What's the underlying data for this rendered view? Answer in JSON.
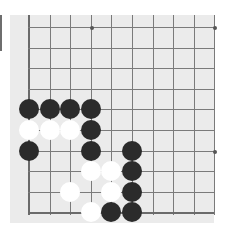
{
  "game": "Go board diagram (corner section)",
  "colors": {
    "board": "#ebebeb",
    "line": "#7a7a7a",
    "black_stone": "#2b2b2b",
    "white_stone": "#ffffff"
  },
  "grid": {
    "columns": 10,
    "rows": 10,
    "origin_x": 29,
    "origin_y": 27,
    "spacing": 20.6,
    "edge_left": true,
    "edge_bottom": true
  },
  "star_points": [
    {
      "col": 3,
      "row": 0
    },
    {
      "col": 9,
      "row": 0
    },
    {
      "col": 9,
      "row": 6
    }
  ],
  "stones": [
    {
      "color": "black",
      "col": 0,
      "row": 4
    },
    {
      "color": "black",
      "col": 1,
      "row": 4
    },
    {
      "color": "black",
      "col": 2,
      "row": 4
    },
    {
      "color": "black",
      "col": 3,
      "row": 4
    },
    {
      "color": "white",
      "col": 0,
      "row": 5
    },
    {
      "color": "white",
      "col": 1,
      "row": 5
    },
    {
      "color": "white",
      "col": 2,
      "row": 5
    },
    {
      "color": "black",
      "col": 3,
      "row": 5
    },
    {
      "color": "black",
      "col": 0,
      "row": 6
    },
    {
      "color": "black",
      "col": 3,
      "row": 6
    },
    {
      "color": "black",
      "col": 5,
      "row": 6
    },
    {
      "color": "white",
      "col": 3,
      "row": 7
    },
    {
      "color": "white",
      "col": 4,
      "row": 7
    },
    {
      "color": "black",
      "col": 5,
      "row": 7
    },
    {
      "color": "white",
      "col": 2,
      "row": 8
    },
    {
      "color": "white",
      "col": 4,
      "row": 8
    },
    {
      "color": "black",
      "col": 5,
      "row": 8
    },
    {
      "color": "white",
      "col": 3,
      "row": 9
    },
    {
      "color": "black",
      "col": 4,
      "row": 9
    },
    {
      "color": "black",
      "col": 5,
      "row": 9
    }
  ]
}
